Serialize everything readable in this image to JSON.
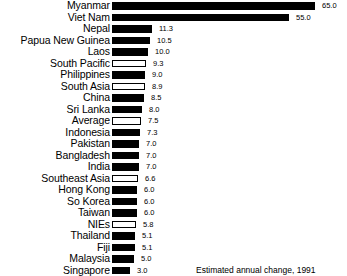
{
  "chart_data": {
    "type": "bar",
    "orientation": "horizontal",
    "title": "",
    "subtitle": "",
    "xlabel": "Estimated annual change, 1991",
    "ylabel": "",
    "grid": false,
    "legend": "none",
    "categories": [
      "Myanmar",
      "Viet Nam",
      "Nepal",
      "Papua New Guinea",
      "Laos",
      "South Pacific",
      "Philippines",
      "South Asia",
      "China",
      "Sri Lanka",
      "Average",
      "Indonesia",
      "Pakistan",
      "Bangladesh",
      "India",
      "Southeast Asia",
      "Hong Kong",
      "So Korea",
      "Taiwan",
      "NIEs",
      "Thailand",
      "Fiji",
      "Malaysia",
      "Singapore"
    ],
    "values": [
      65.0,
      55.0,
      11.3,
      10.5,
      10.0,
      9.3,
      9.0,
      8.9,
      8.5,
      8.0,
      7.5,
      7.3,
      7.0,
      7.0,
      7.0,
      6.6,
      6.0,
      6.0,
      6.0,
      5.8,
      5.1,
      5.1,
      5.0,
      3.0
    ],
    "value_labels": [
      "65.0",
      "55.0",
      "11.3",
      "10.5",
      "10.0",
      "9.3",
      "9.0",
      "8.9",
      "8.5",
      "8.0",
      "7.5",
      "7.3",
      "7.0",
      "7.0",
      "7.0",
      "6.6",
      "6.0",
      "6.0",
      "6.0",
      "5.8",
      "5.1",
      "5.1",
      "5.0",
      "3.0"
    ],
    "bar_styles": [
      "solid",
      "solid",
      "solid",
      "solid",
      "solid",
      "hollow",
      "solid",
      "hollow",
      "solid",
      "solid",
      "hollow",
      "solid",
      "solid",
      "solid",
      "solid",
      "hollow",
      "solid",
      "solid",
      "solid",
      "hollow",
      "solid",
      "solid",
      "solid",
      "solid"
    ],
    "bar_pixel_widths": [
      203,
      177,
      40,
      38,
      36,
      34,
      33,
      33,
      32,
      30,
      29,
      28,
      27,
      27,
      27,
      26,
      25,
      25,
      25,
      24,
      23,
      23,
      22,
      18
    ],
    "colors": {
      "solid_bar": "#000000",
      "hollow_bar_fill": "#ffffff",
      "hollow_bar_outline": "#000000",
      "background": "#ffffff",
      "text": "#000000"
    }
  },
  "footer": {
    "caption": "Estimated annual change, 1991"
  }
}
